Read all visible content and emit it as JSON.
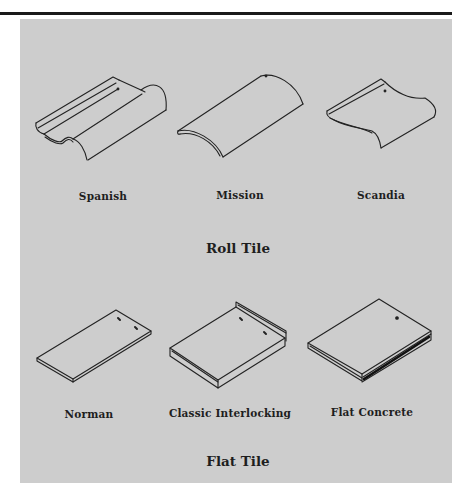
{
  "figure": {
    "background_color": "#cdcdcd",
    "rule_color": "#1a1a1a",
    "groups": [
      {
        "title": "Roll Tile",
        "tiles": [
          {
            "name": "Spanish"
          },
          {
            "name": "Mission"
          },
          {
            "name": "Scandia"
          }
        ]
      },
      {
        "title": "Flat Tile",
        "tiles": [
          {
            "name": "Norman"
          },
          {
            "name": "Classic Interlocking"
          },
          {
            "name": "Flat Concrete"
          }
        ]
      }
    ]
  }
}
